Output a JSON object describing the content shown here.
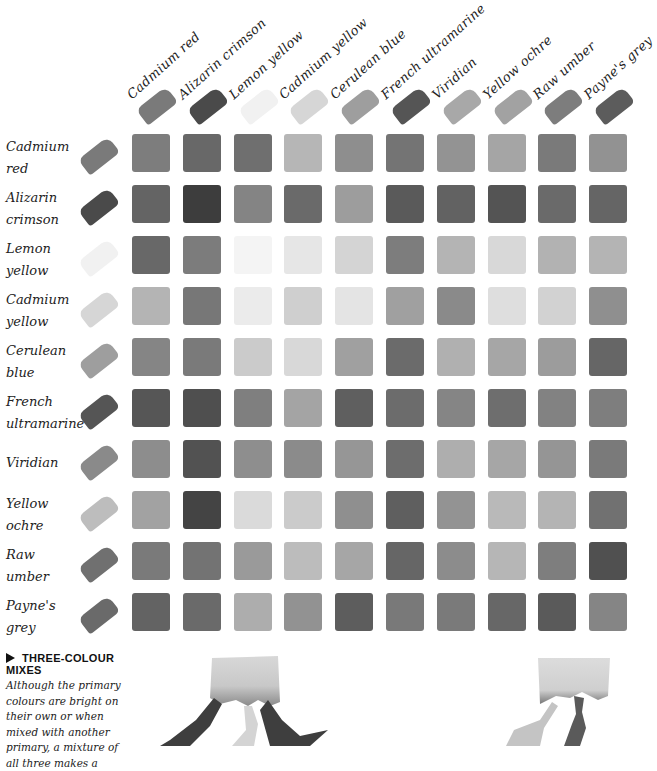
{
  "columns": [
    {
      "label": "Cadmium red",
      "tone": "#7a7a7a"
    },
    {
      "label": "Alizarin crimson",
      "tone": "#4a4a4a"
    },
    {
      "label": "Lemon yellow",
      "tone": "#f1f1f1"
    },
    {
      "label": "Cadmium yellow",
      "tone": "#d6d6d6"
    },
    {
      "label": "Cerulean blue",
      "tone": "#9e9e9e"
    },
    {
      "label": "French ultramarine",
      "tone": "#555555"
    },
    {
      "label": "Viridian",
      "tone": "#a8a8a8"
    },
    {
      "label": "Yellow ochre",
      "tone": "#a2a2a2"
    },
    {
      "label": "Raw umber",
      "tone": "#7d7d7d"
    },
    {
      "label": "Payne's grey",
      "tone": "#5c5c5c"
    }
  ],
  "rows": [
    {
      "label_line1": "Cadmium",
      "label_line2": "red",
      "tone": "#7a7a7a",
      "cells": [
        "#7d7d7d",
        "#686868",
        "#6f6f6f",
        "#b6b6b6",
        "#8e8e8e",
        "#747474",
        "#939393",
        "#a5a5a5",
        "#7a7a7a",
        "#929292"
      ]
    },
    {
      "label_line1": "Alizarin",
      "label_line2": "crimson",
      "tone": "#4a4a4a",
      "cells": [
        "#646464",
        "#3d3d3d",
        "#848484",
        "#6a6a6a",
        "#9d9d9d",
        "#5a5a5a",
        "#626262",
        "#545454",
        "#6a6a6a",
        "#656565"
      ]
    },
    {
      "label_line1": "Lemon",
      "label_line2": "yellow",
      "tone": "#f1f1f1",
      "cells": [
        "#686868",
        "#7c7c7c",
        "#f4f4f4",
        "#e6e6e6",
        "#d4d4d4",
        "#7d7d7d",
        "#b4b4b4",
        "#d8d8d8",
        "#b2b2b2",
        "#b4b4b4"
      ]
    },
    {
      "label_line1": "Cadmium",
      "label_line2": "yellow",
      "tone": "#d6d6d6",
      "cells": [
        "#b4b4b4",
        "#777777",
        "#ebebeb",
        "#cfcfcf",
        "#e4e4e4",
        "#a0a0a0",
        "#8a8a8a",
        "#dedede",
        "#d2d2d2",
        "#8f8f8f"
      ]
    },
    {
      "label_line1": "Cerulean",
      "label_line2": "blue",
      "tone": "#9e9e9e",
      "cells": [
        "#858585",
        "#7a7a7a",
        "#cbcbcb",
        "#d8d8d8",
        "#a0a0a0",
        "#6b6b6b",
        "#b0b0b0",
        "#a6a6a6",
        "#9c9c9c",
        "#666666"
      ]
    },
    {
      "label_line1": "French",
      "label_line2": "ultramarine",
      "tone": "#555555",
      "cells": [
        "#565656",
        "#4f4f4f",
        "#7f7f7f",
        "#a4a4a4",
        "#5f5f5f",
        "#6c6c6c",
        "#858585",
        "#6e6e6e",
        "#828282",
        "#7e7e7e"
      ]
    },
    {
      "label_line1": "Viridian",
      "label_line2": "",
      "tone": "#8a8a8a",
      "cells": [
        "#8d8d8d",
        "#525252",
        "#8e8e8e",
        "#8b8b8b",
        "#969696",
        "#6d6d6d",
        "#aeaeae",
        "#a6a6a6",
        "#959595",
        "#7a7a7a"
      ]
    },
    {
      "label_line1": "Yellow",
      "label_line2": "ochre",
      "tone": "#bdbdbd",
      "cells": [
        "#a2a2a2",
        "#444444",
        "#dadada",
        "#cbcbcb",
        "#8f8f8f",
        "#5f5f5f",
        "#939393",
        "#b9b9b9",
        "#b4b4b4",
        "#717171"
      ]
    },
    {
      "label_line1": "Raw",
      "label_line2": "umber",
      "tone": "#707070",
      "cells": [
        "#7a7a7a",
        "#737373",
        "#9a9a9a",
        "#bcbcbc",
        "#a6a6a6",
        "#666666",
        "#8c8c8c",
        "#b6b6b6",
        "#7e7e7e",
        "#505050"
      ]
    },
    {
      "label_line1": "Payne's",
      "label_line2": "grey",
      "tone": "#6a6a6a",
      "cells": [
        "#636363",
        "#6a6a6a",
        "#adadad",
        "#929292",
        "#5d5d5d",
        "#797979",
        "#7a7a7a",
        "#676767",
        "#5a5a5a",
        "#858585"
      ]
    }
  ],
  "footer": {
    "title": "THREE-COLOUR MIXES",
    "text_lines": [
      "Although the primary",
      "colours are bright on",
      "their own or when",
      "mixed with another",
      "primary, a mixture of",
      "all three makes a"
    ]
  }
}
